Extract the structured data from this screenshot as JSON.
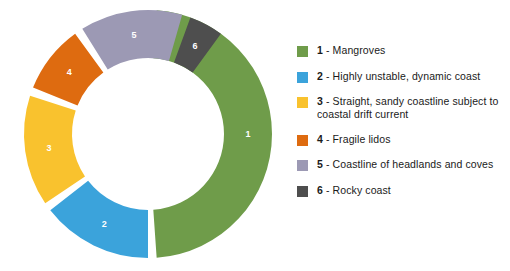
{
  "chart_data": {
    "type": "pie",
    "title": "",
    "subtitle": "",
    "xlabel": "",
    "ylabel": "",
    "legend_position": "right",
    "grid": false,
    "donut": true,
    "inner_radius_ratio": 0.61,
    "start_angle_deg": 0,
    "direction": "clockwise",
    "gap_deg": 4,
    "categories": [
      "Mangroves",
      "Highly unstable, dynamic coast",
      "Straight, sandy coastline subject to coastal drift current",
      "Fragile lidos",
      "Coastline of headlands and coves",
      "Rocky coast"
    ],
    "values": [
      172,
      52,
      52,
      32,
      48,
      16
    ],
    "value_unit": "degrees",
    "percentages": [
      47.8,
      14.4,
      14.4,
      8.9,
      13.3,
      4.4
    ],
    "slice_labels": [
      "1",
      "2",
      "3",
      "4",
      "5",
      "6"
    ],
    "colors": [
      "#6f9c4a",
      "#3ba3db",
      "#f9c22e",
      "#de6b10",
      "#9c99b4",
      "#4e4e4e"
    ]
  },
  "chart": {
    "center_x": 148,
    "center_y": 134,
    "outer_radius": 124,
    "inner_radius": 76,
    "slices": [
      {
        "id": "1",
        "label": "1",
        "color": "#6f9c4a",
        "start": 4,
        "end": 176,
        "name": "mangroves"
      },
      {
        "id": "2",
        "label": "2",
        "color": "#3ba3db",
        "start": 180,
        "end": 232,
        "name": "highly-unstable-dynamic-coast"
      },
      {
        "id": "3",
        "label": "3",
        "color": "#f9c22e",
        "start": 236,
        "end": 288,
        "name": "straight-sandy-coastline"
      },
      {
        "id": "4",
        "label": "4",
        "color": "#de6b10",
        "start": 292,
        "end": 324,
        "name": "fragile-lidos"
      },
      {
        "id": "5",
        "label": "5",
        "color": "#9c99b4",
        "start": 328,
        "end": 376,
        "name": "coastline-of-headlands-and-coves"
      },
      {
        "id": "6",
        "label": "6",
        "color": "#4e4e4e",
        "start": 380,
        "end": 396,
        "name": "rocky-coast"
      }
    ]
  },
  "legend": {
    "separator": "-",
    "items": [
      {
        "index": "1",
        "label": "Mangroves",
        "color": "#6f9c4a"
      },
      {
        "index": "2",
        "label": "Highly unstable, dynamic coast",
        "color": "#3ba3db"
      },
      {
        "index": "3",
        "label": "Straight, sandy coastline subject to coastal drift current",
        "color": "#f9c22e"
      },
      {
        "index": "4",
        "label": "Fragile lidos",
        "color": "#de6b10"
      },
      {
        "index": "5",
        "label": "Coastline of headlands and coves",
        "color": "#9c99b4"
      },
      {
        "index": "6",
        "label": "Rocky coast",
        "color": "#4e4e4e"
      }
    ]
  }
}
